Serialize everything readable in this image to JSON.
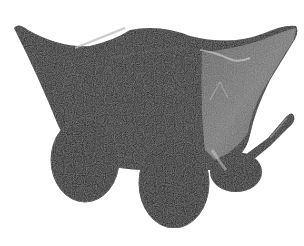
{
  "image": {
    "description": "Black-and-white photograph of an ancient clay wagon model with four solid wheels, a boat-shaped body with upturned corners, and a protruding draught pole",
    "subject": "clay-wagon-model",
    "background_color": "#ffffff",
    "palette": {
      "body_dark": "#141414",
      "body_mid": "#262626",
      "side_panel_grey": "#6b6b6b",
      "highlight": "#bdbdbd",
      "wheel": "#0e0e0e"
    }
  }
}
